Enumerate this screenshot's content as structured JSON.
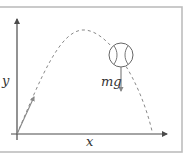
{
  "diagram": {
    "labels": {
      "x_axis": "x",
      "y_axis": "y",
      "force": "mg"
    },
    "colors": {
      "frame": "#bdbdbd",
      "axis": "#4a4a4a",
      "trajectory": "#7a7a7a",
      "ball": "#666666",
      "force_arrow": "#777777",
      "velocity_arrow": "#888888",
      "text": "#333333"
    },
    "elements": [
      "frame",
      "x-axis with arrow",
      "y-axis with arrow",
      "dashed parabolic trajectory",
      "initial velocity arrow",
      "baseball",
      "gravity force arrow"
    ]
  }
}
